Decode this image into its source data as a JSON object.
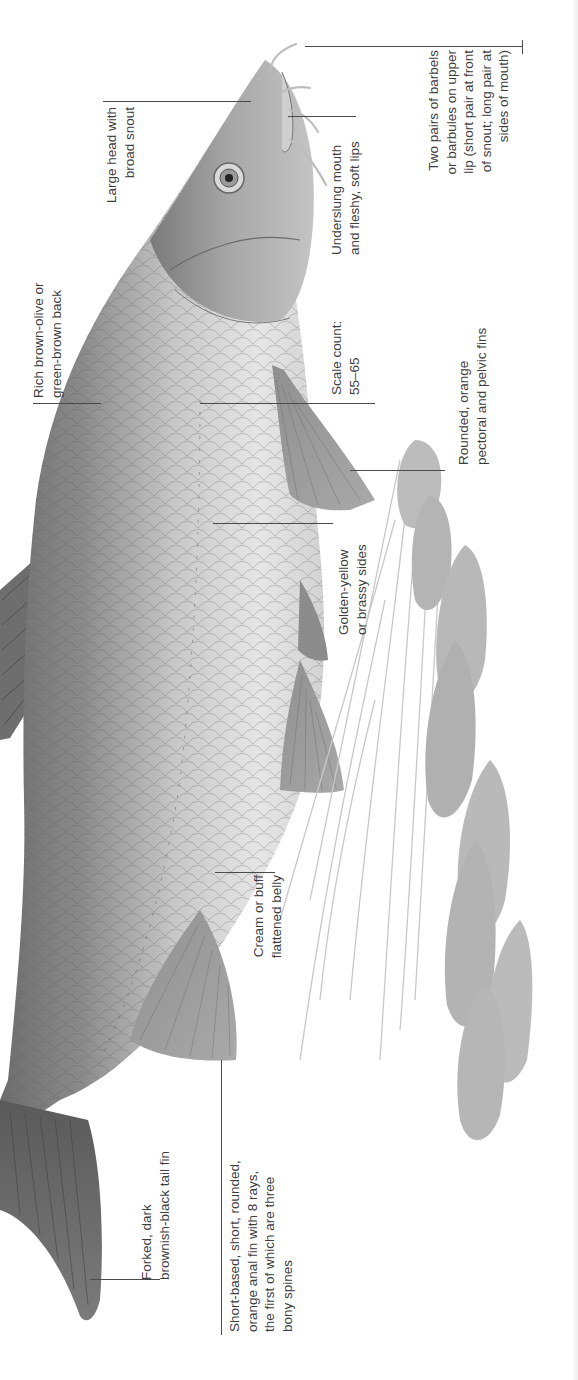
{
  "page": {
    "orientation": "rotated-90",
    "background": "#ffffff",
    "text_color": "#3d3d3d",
    "leader_color": "#4a4a4a"
  },
  "labels": {
    "barbels": {
      "lines": [
        "Two pairs of barbels",
        "or barbules on upper",
        "lip (short pair at front",
        "of snout; long pair at",
        "sides of mouth)"
      ]
    },
    "head": {
      "lines": [
        "Large head with",
        "broad snout"
      ]
    },
    "mouth": {
      "lines": [
        "Underslung mouth",
        "and fleshy, soft lips"
      ]
    },
    "back": {
      "lines": [
        "Rich brown-olive or",
        "green-brown back"
      ]
    },
    "scales": {
      "lines": [
        "Scale count:",
        "55–65"
      ]
    },
    "pectoral": {
      "lines": [
        "Rounded, orange",
        "pectoral and pelvic fins"
      ]
    },
    "sides": {
      "lines": [
        "Golden-yellow",
        "or brassy sides"
      ]
    },
    "belly": {
      "lines": [
        "Cream or buff",
        "flattened belly"
      ]
    },
    "tail": {
      "lines": [
        "Forked, dark",
        "brownish-black tail fin"
      ]
    },
    "anal_fin": {
      "lines": [
        "Short-based, short, rounded,",
        "orange anal fin with 8 rays,",
        "the first of which are three",
        "bony spines"
      ]
    }
  }
}
